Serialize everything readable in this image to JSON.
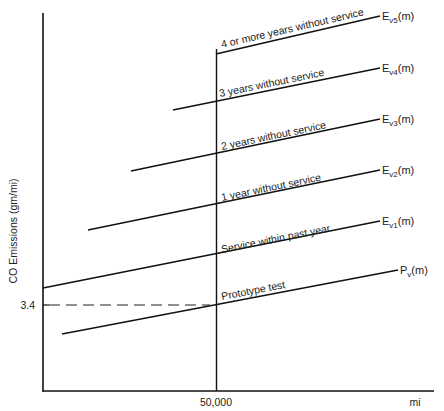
{
  "chart_data": {
    "type": "line",
    "title": "",
    "xlabel": "mi",
    "ylabel": "CO Emissions (gm/mi)",
    "x_ticks": [
      {
        "value": 50000,
        "label": "50,000"
      }
    ],
    "y_ticks": [
      {
        "value": 3.4,
        "label": "3.4"
      }
    ],
    "grid": false,
    "legend": "inline end labels",
    "reference_lines": {
      "vertical_at_x": "50,000",
      "dashed_horizontal_at_y": "3.4"
    },
    "series": [
      {
        "name": "Prototype test",
        "end_label": "P",
        "end_sub": "v",
        "end_suffix": "(m)",
        "x1": 62,
        "y1": 334,
        "x2": 398,
        "y2": 270,
        "label_x": 222,
        "label_y": 300,
        "angle": -10.8
      },
      {
        "name": "Service within past year",
        "end_label": "E",
        "end_sub": "v1",
        "end_suffix": "(m)",
        "x1": 43,
        "y1": 288,
        "x2": 380,
        "y2": 221,
        "label_x": 222,
        "label_y": 253,
        "angle": -11.2
      },
      {
        "name": "1 year without service",
        "end_label": "E",
        "end_sub": "v2",
        "end_suffix": "(m)",
        "x1": 88,
        "y1": 230,
        "x2": 380,
        "y2": 170,
        "label_x": 222,
        "label_y": 201,
        "angle": -11.6
      },
      {
        "name": "2 years without service",
        "end_label": "E",
        "end_sub": "v3",
        "end_suffix": "(m)",
        "x1": 131,
        "y1": 171,
        "x2": 380,
        "y2": 119,
        "label_x": 222,
        "label_y": 150,
        "angle": -11.8
      },
      {
        "name": "3 years without service",
        "end_label": "E",
        "end_sub": "v4",
        "end_suffix": "(m)",
        "x1": 173,
        "y1": 110,
        "x2": 380,
        "y2": 68,
        "label_x": 220,
        "label_y": 97,
        "angle": -11.5
      },
      {
        "name": "4 or more years without service",
        "end_label": "E",
        "end_sub": "v5",
        "end_suffix": "(m)",
        "x1": 216,
        "y1": 54,
        "x2": 380,
        "y2": 16,
        "label_x": 222,
        "label_y": 48,
        "angle": -13.0
      }
    ]
  }
}
